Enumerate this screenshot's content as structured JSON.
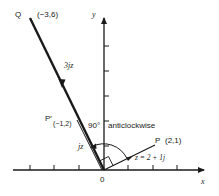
{
  "diagram": {
    "type": "argand-diagram-rotation",
    "axes": {
      "x_label": "x",
      "y_label": "y",
      "origin_label": "0"
    },
    "points": {
      "Q": {
        "name": "Q",
        "coords": "(−3,6)"
      },
      "P_prime": {
        "name": "P′",
        "coords": "(−1,2)"
      },
      "P": {
        "name": "P",
        "coords": "(2,1)"
      }
    },
    "vectors": {
      "z": "z = 2 + 1j",
      "jz": "jz",
      "threejz": "3jz"
    },
    "annotation": {
      "angle": "90°",
      "direction": "anticlockwise"
    },
    "colors": {
      "ink": "#1a1a1a",
      "background": "#ffffff"
    }
  }
}
